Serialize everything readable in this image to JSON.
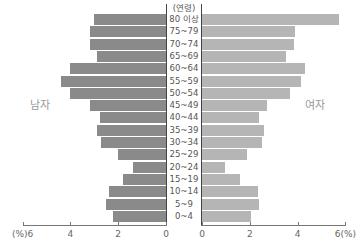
{
  "chart_data": {
    "type": "bar",
    "subtype": "population-pyramid",
    "title": "",
    "categories_header": "(연령)",
    "categories": [
      "80 이상",
      "75~79",
      "70~74",
      "65~69",
      "60~64",
      "55~59",
      "50~54",
      "45~49",
      "40~44",
      "35~39",
      "30~34",
      "25~29",
      "20~24",
      "15~19",
      "10~14",
      "5~9",
      "0~4"
    ],
    "series": [
      {
        "name": "남자",
        "side": "left",
        "color": "#8a8a8a",
        "values": [
          3.0,
          3.2,
          3.2,
          2.9,
          4.0,
          4.4,
          4.0,
          3.2,
          2.75,
          2.9,
          2.7,
          2.0,
          1.4,
          1.8,
          2.4,
          2.5,
          2.2
        ]
      },
      {
        "name": "여자",
        "side": "right",
        "color": "#b5b5b5",
        "values": [
          5.75,
          3.9,
          3.85,
          3.5,
          4.3,
          4.15,
          3.7,
          2.7,
          2.4,
          2.6,
          2.5,
          1.9,
          0.95,
          1.6,
          2.35,
          2.4,
          2.05
        ]
      }
    ],
    "xlabel": "(%)",
    "ylabel": "(연령)",
    "xlim": [
      0,
      6
    ],
    "x_ticks_left": [
      "(%)6",
      "4",
      "2",
      "0"
    ],
    "x_ticks_right": [
      "0",
      "2",
      "4",
      "6(%)"
    ],
    "grid": false,
    "legend": {
      "left_label": "남자",
      "right_label": "여자"
    }
  }
}
